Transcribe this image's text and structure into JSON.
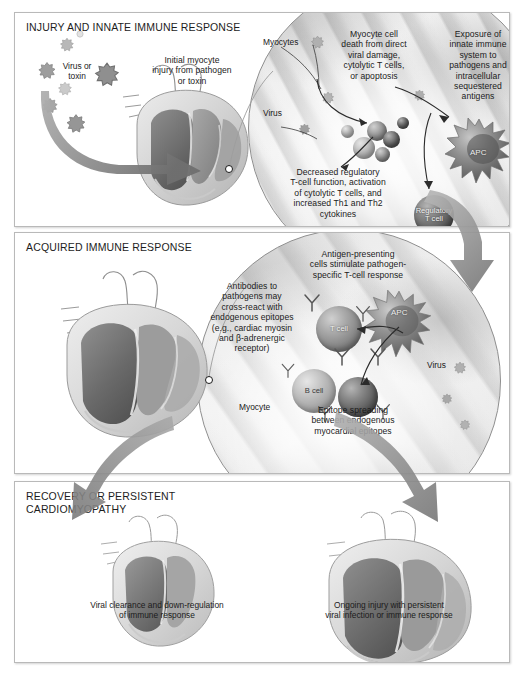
{
  "figure": {
    "background_color": "#ffffff",
    "accent_color": "#8a8a8a"
  },
  "panels": [
    {
      "id": "injury",
      "title": "INJURY AND INNATE IMMUNE RESPONSE",
      "labels": [
        {
          "name": "virus-or-toxin",
          "text": "Virus or\ntoxin"
        },
        {
          "name": "myocytes",
          "text": "Myocytes"
        },
        {
          "name": "virus",
          "text": "Virus"
        },
        {
          "name": "apc",
          "text": "APC"
        },
        {
          "name": "regulatory-t-cell",
          "text": "Regulatory\nT cell"
        }
      ],
      "callouts": [
        {
          "name": "initial-myocyte-injury",
          "text": "Initial myocyte\ninjury from pathogen\nor toxin"
        },
        {
          "name": "myocyte-cell-death",
          "text": "Myocyte cell\ndeath from direct\nviral damage,\ncytolytic T cells,\nor apoptosis"
        },
        {
          "name": "exposure-innate-immune",
          "text": "Exposure of\ninnate immune\nsystem to\npathogens and\nintracellular\nsequestered\nantigens"
        },
        {
          "name": "decreased-regulatory-t-cell",
          "text": "Decreased regulatory\nT-cell function, activation\nof cytolytic T cells, and\nincreased Th1 and Th2\ncytokines"
        }
      ]
    },
    {
      "id": "acquired",
      "title": "ACQUIRED IMMUNE RESPONSE",
      "labels": [
        {
          "name": "t-cell",
          "text": "T cell"
        },
        {
          "name": "b-cell",
          "text": "B cell"
        },
        {
          "name": "apc",
          "text": "APC"
        },
        {
          "name": "virus",
          "text": "Virus"
        },
        {
          "name": "myocyte",
          "text": "Myocyte"
        }
      ],
      "callouts": [
        {
          "name": "antigen-presenting-cells",
          "text": "Antigen-presenting\ncells stimulate pathogen-\nspecific T-cell response"
        },
        {
          "name": "antibodies-cross-react",
          "text": "Antibodies to\npathogens may\ncross-react with\nendogenous epitopes\n(e.g., cardiac myosin\nand β-adrenergic\nreceptor)"
        },
        {
          "name": "epitope-spreading",
          "text": "Epitope spreading\nbetween endogenous\nmyocardial epitopes"
        }
      ]
    },
    {
      "id": "recovery",
      "title": "RECOVERY OR PERSISTENT\nCARDIOMYOPATHY",
      "labels": [],
      "callouts": [
        {
          "name": "viral-clearance",
          "text": "Viral clearance and down-regulation\nof immune response"
        },
        {
          "name": "ongoing-injury",
          "text": "Ongoing injury with persistent\nviral infection or immune response"
        }
      ]
    }
  ]
}
